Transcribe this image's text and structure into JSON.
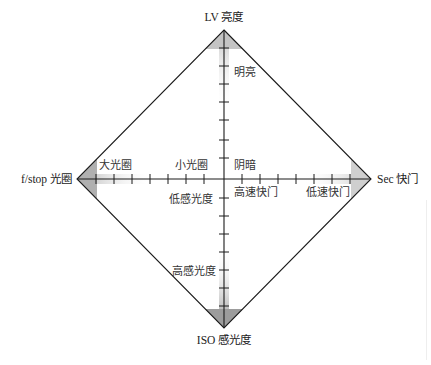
{
  "diagram": {
    "colors": {
      "line": "#1a1a1a",
      "shade_dark": "#9a9a9a",
      "shade_light": "#d9d9d9",
      "text": "#333333",
      "background": "#ffffff"
    },
    "vertices": {
      "top": {
        "label": "LV 亮度",
        "x": 224,
        "y": 30
      },
      "left": {
        "label": "f/stop 光圈",
        "x": 77,
        "y": 179
      },
      "right": {
        "label": "Sec 快门",
        "x": 371,
        "y": 179
      },
      "bottom": {
        "label": "ISO 感光度",
        "x": 224,
        "y": 328
      }
    },
    "axis_annotations": {
      "top_upper": "明亮",
      "top_lower": "阴暗",
      "left_outer": "大光圈",
      "left_inner": "小光圈",
      "right_inner": "高速快门",
      "right_outer": "低速快门",
      "bottom_inner": "低感光度",
      "bottom_outer": "高感光度"
    },
    "ticks": {
      "top": [
        48,
        66,
        84,
        102,
        120,
        140,
        158
      ],
      "bottom": [
        198,
        216,
        234,
        252,
        270,
        288,
        306
      ],
      "left": [
        96,
        114,
        132,
        150,
        168,
        186,
        204
      ],
      "right": [
        242,
        260,
        278,
        296,
        314,
        332,
        350
      ]
    }
  }
}
